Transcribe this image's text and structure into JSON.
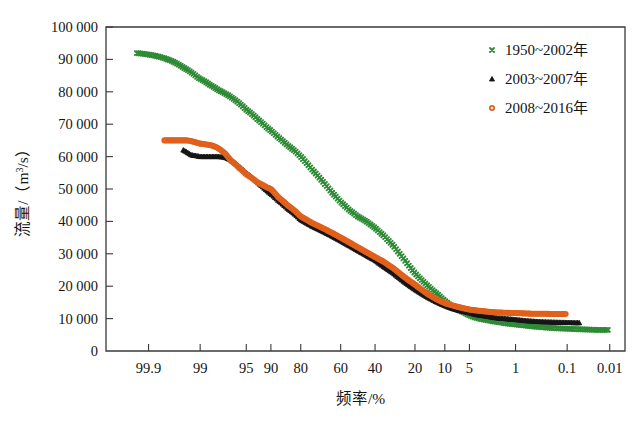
{
  "figure": {
    "background": "#ffffff",
    "frame_color": "#3a3a3a"
  },
  "chart_data": {
    "type": "scatter",
    "title": "",
    "subtitle": "",
    "xlabel": "频率/%",
    "ylabel": "流量/（m3/s）",
    "ylabel_parts": {
      "prefix": "流量/（m",
      "exponent": "3",
      "suffix": "/s）"
    },
    "x_scale": "probability",
    "x_axis_note": "Exceedance probability scale, decreasing left to right",
    "x_tick_labels": [
      "99.9",
      "99",
      "95",
      "90",
      "80",
      "60",
      "40",
      "20",
      "10",
      "5",
      "1",
      "0.1",
      "0.01"
    ],
    "x_tick_values": [
      99.9,
      99,
      95,
      90,
      80,
      60,
      40,
      20,
      10,
      5,
      1,
      0.1,
      0.01
    ],
    "xlim": [
      99.99,
      0.004
    ],
    "y_tick_labels": [
      "0",
      "10 000",
      "20 000",
      "30 000",
      "40 000",
      "50 000",
      "60 000",
      "70 000",
      "80 000",
      "90 000",
      "100 000"
    ],
    "y_tick_values": [
      0,
      10000,
      20000,
      30000,
      40000,
      50000,
      60000,
      70000,
      80000,
      90000,
      100000
    ],
    "ylim": [
      0,
      100000
    ],
    "grid": false,
    "legend_position": "top-right",
    "series": [
      {
        "name": "1950~2002年",
        "label": "1950~2002年",
        "color": "#2e8b35",
        "marker": "x",
        "x": [
          99.95,
          99.9,
          99.8,
          99.7,
          99.6,
          99.5,
          99.3,
          99.1,
          99.0,
          98.5,
          98.0,
          97.0,
          96.0,
          95.0,
          93.0,
          91.0,
          90.0,
          88.0,
          85.0,
          82.0,
          80.0,
          75.0,
          70.0,
          65.0,
          60.0,
          55.0,
          50.0,
          45.0,
          40.0,
          35.0,
          30.0,
          25.0,
          20.0,
          15.0,
          12.0,
          10.0,
          8.0,
          6.0,
          5.0,
          4.0,
          3.0,
          2.0,
          1.5,
          1.0,
          0.7,
          0.5,
          0.3,
          0.2,
          0.1,
          0.05,
          0.03,
          0.02,
          0.01
        ],
        "y": [
          92000,
          91500,
          90500,
          89500,
          88500,
          87500,
          86000,
          84500,
          84000,
          82000,
          80500,
          78500,
          76500,
          74500,
          71500,
          69000,
          68000,
          66000,
          63500,
          61500,
          60000,
          56000,
          52500,
          49000,
          46000,
          43500,
          41500,
          40000,
          38000,
          35500,
          32500,
          28500,
          24000,
          20000,
          17500,
          15500,
          13500,
          12000,
          11000,
          10200,
          9600,
          9000,
          8600,
          8200,
          7900,
          7600,
          7300,
          7100,
          6900,
          6700,
          6600,
          6500,
          6500
        ]
      },
      {
        "name": "2003~2007年",
        "label": "2003~2007年",
        "color": "#151515",
        "marker": "triangle",
        "x": [
          99.5,
          99.3,
          99.1,
          99.0,
          98.7,
          98.4,
          98.0,
          97.5,
          97.0,
          96.0,
          95.0,
          93.0,
          91.0,
          90.0,
          88.0,
          85.0,
          82.0,
          80.0,
          75.0,
          70.0,
          65.0,
          60.0,
          55.0,
          50.0,
          45.0,
          40.0,
          35.0,
          30.0,
          25.0,
          20.0,
          15.0,
          12.0,
          10.0,
          8.0,
          6.0,
          5.0,
          4.0,
          3.0,
          2.0,
          1.5,
          1.0,
          0.7,
          0.5,
          0.3,
          0.2,
          0.1,
          0.05
        ],
        "y": [
          62000,
          60500,
          60200,
          60000,
          60000,
          60000,
          60000,
          59800,
          59000,
          57000,
          55000,
          52000,
          49500,
          48500,
          46500,
          44000,
          42000,
          40500,
          38500,
          37000,
          35500,
          34000,
          32500,
          31000,
          29500,
          28000,
          26000,
          24000,
          21500,
          19000,
          16500,
          15000,
          14000,
          13000,
          12200,
          11800,
          11200,
          10800,
          10200,
          10000,
          9700,
          9400,
          9200,
          9000,
          8900,
          8800,
          8700
        ]
      },
      {
        "name": "2008~2016年",
        "label": "2008~2016年",
        "color": "#e0601c",
        "marker": "circle",
        "x": [
          99.8,
          99.6,
          99.4,
          99.2,
          99.1,
          99.0,
          98.8,
          98.5,
          98.2,
          98.0,
          97.5,
          97.0,
          96.0,
          95.0,
          93.0,
          91.0,
          90.0,
          88.0,
          85.0,
          82.0,
          80.0,
          75.0,
          70.0,
          65.0,
          60.0,
          55.0,
          50.0,
          45.0,
          40.0,
          35.0,
          30.0,
          25.0,
          20.0,
          15.0,
          12.0,
          10.0,
          8.0,
          6.0,
          5.0,
          4.0,
          3.0,
          2.0,
          1.5,
          1.0,
          0.7,
          0.5,
          0.3,
          0.2,
          0.15,
          0.1
        ],
        "y": [
          65000,
          65000,
          65000,
          64500,
          64200,
          64000,
          63800,
          63500,
          63000,
          62500,
          61000,
          59000,
          56500,
          54500,
          52000,
          50500,
          50000,
          47500,
          45000,
          43000,
          41500,
          39500,
          38000,
          36500,
          35000,
          33500,
          32000,
          30500,
          29000,
          27500,
          25500,
          23000,
          20500,
          17500,
          15800,
          14800,
          14000,
          13200,
          12800,
          12500,
          12200,
          11900,
          11800,
          11700,
          11600,
          11500,
          11500,
          11400,
          11400,
          11400
        ]
      }
    ]
  }
}
